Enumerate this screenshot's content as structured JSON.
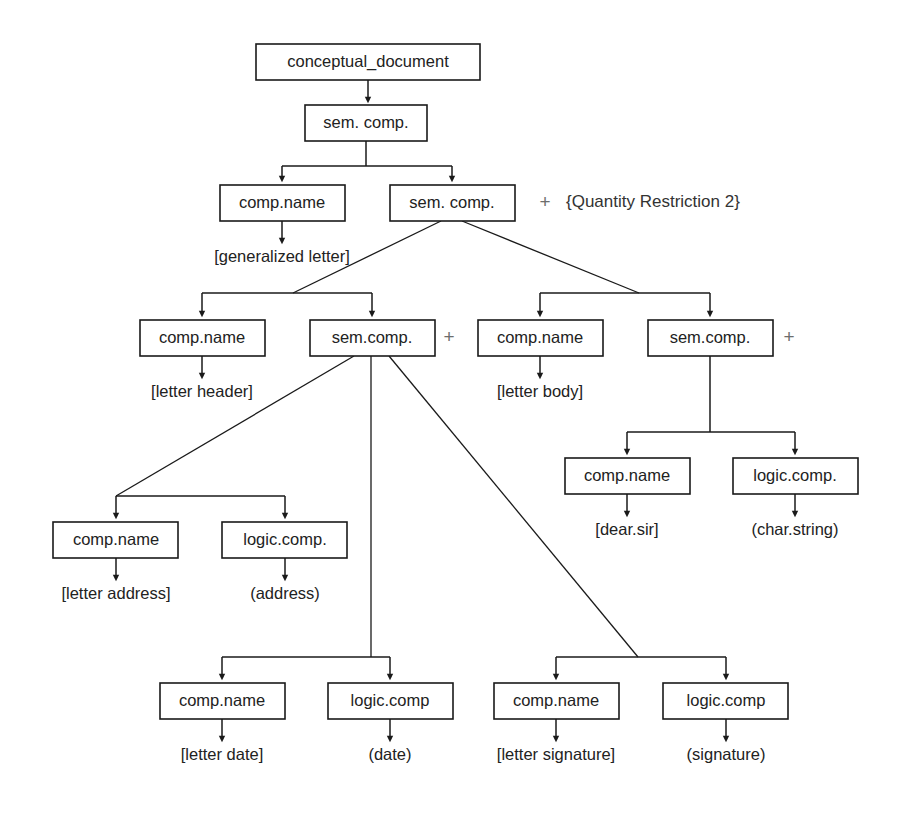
{
  "diagram": {
    "nodes": {
      "root": "conceptual_document",
      "sem_comp_1": "sem. comp.",
      "comp_name_generalized": "comp.name",
      "sem_comp_2": "sem. comp.",
      "comp_name_header": "comp.name",
      "sem_comp_header": "sem.comp.",
      "comp_name_body": "comp.name",
      "sem_comp_body": "sem.comp.",
      "comp_name_dear_sir": "comp.name",
      "logic_comp_char_string": "logic.comp.",
      "comp_name_address": "comp.name",
      "logic_comp_address": "logic.comp.",
      "comp_name_date": "comp.name",
      "logic_comp_date": "logic.comp",
      "comp_name_signature": "comp.name",
      "logic_comp_signature": "logic.comp"
    },
    "leaves": {
      "generalized_letter": "[generalized letter]",
      "letter_header": "[letter header]",
      "letter_body": "[letter body]",
      "dear_sir": "[dear.sir]",
      "char_string": "(char.string)",
      "letter_address": "[letter address]",
      "address": "(address)",
      "letter_date": "[letter date]",
      "date": "(date)",
      "letter_signature": "[letter signature]",
      "signature": "(signature)"
    },
    "annotations": {
      "plus_quantity": "+",
      "quantity_restriction": "{Quantity Restriction 2}",
      "plus_header": "+",
      "plus_body": "+"
    },
    "colors": {
      "stroke": "#1a1a1a",
      "text": "#222222",
      "background": "#ffffff",
      "plus": "#6d6d6d"
    }
  }
}
